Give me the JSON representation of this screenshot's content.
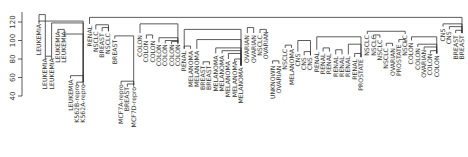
{
  "chart_data": {
    "type": "dendrogram",
    "title": "",
    "xlabel": "",
    "ylabel": "",
    "ylim": [
      40,
      130
    ],
    "yticks": [
      40,
      60,
      80,
      100,
      120
    ],
    "leaves": [
      "LEUKEMIA",
      "LEUKEMIA",
      "LEUKEMIA",
      "LEUKEMIA",
      "LEUKEMIA",
      "LEUKEMIA",
      "K562B-repro",
      "K562A-repro",
      "RENAL",
      "NSCLC",
      "BREAST",
      "NSCLC",
      "BREAST",
      "MCF7A-repro",
      "BREAST",
      "MCF7D-repro",
      "COLON",
      "COLON",
      "COLON",
      "COLON",
      "COLON",
      "COLON",
      "COLON",
      "RENAL",
      "MELANOMA",
      "MELANOMA",
      "BREAST",
      "BREAST",
      "MELANOMA",
      "MELANOMA",
      "MELANOMA",
      "MELANOMA",
      "MELANOMA",
      "OVARIAN",
      "OVARIAN",
      "NSCLC",
      "OVARIAN",
      "UNKNOWN",
      "OVARIAN",
      "NSCLC",
      "MELANOMA",
      "CNS",
      "CNS",
      "CNS",
      "RENAL",
      "RENAL",
      "RENAL",
      "RENAL",
      "RENAL",
      "RENAL",
      "RENAL",
      "PROSTATE",
      "NSCLC",
      "NSCLC",
      "NSCLC",
      "NSCLC",
      "OVARIAN",
      "PROSTATE",
      "NSCLC",
      "COLON",
      "COLON",
      "OVARIAN",
      "COLON",
      "COLON",
      "CNS",
      "CNS",
      "BREAST",
      "BREAST"
    ],
    "leaf_heights": [
      120,
      83,
      83,
      112,
      112,
      60,
      55,
      55,
      118,
      112,
      110,
      110,
      103,
      55,
      52,
      52,
      108,
      102,
      102,
      98,
      98,
      98,
      98,
      91,
      91,
      91,
      75,
      75,
      86,
      86,
      80,
      80,
      73,
      108,
      108,
      108,
      112,
      75,
      75,
      93,
      93,
      88,
      84,
      84,
      90,
      88,
      88,
      85,
      85,
      85,
      82,
      82,
      108,
      108,
      103,
      94,
      94,
      98,
      108,
      100,
      94,
      92,
      88,
      86,
      115,
      112,
      108,
      108
    ],
    "merges": [
      {
        "a": 0,
        "b": 1,
        "h": 128
      },
      {
        "a": 1,
        "b": 2,
        "h": 83
      },
      {
        "a": 3,
        "b": 4,
        "h": 112
      },
      {
        "a": 5,
        "b": 7,
        "h": 62
      },
      {
        "a": 6,
        "b": 7,
        "h": 55
      },
      {
        "a": 4,
        "b": 7,
        "h": 107
      },
      {
        "a": 2,
        "b": 7,
        "h": 119
      },
      {
        "a": 0,
        "b": 7,
        "h": 121
      },
      {
        "a": 8,
        "b": 67,
        "h": 125
      },
      {
        "a": 10,
        "b": 11,
        "h": 114
      },
      {
        "a": 9,
        "b": 11,
        "h": 117
      },
      {
        "a": 13,
        "b": 15,
        "h": 56
      },
      {
        "a": 14,
        "b": 15,
        "h": 53
      },
      {
        "a": 12,
        "b": 15,
        "h": 105
      },
      {
        "a": 16,
        "b": 22,
        "h": 118
      },
      {
        "a": 17,
        "b": 18,
        "h": 106
      },
      {
        "a": 19,
        "b": 22,
        "h": 103
      },
      {
        "a": 20,
        "b": 22,
        "h": 100
      },
      {
        "a": 21,
        "b": 22,
        "h": 99
      },
      {
        "a": 23,
        "b": 32,
        "h": 112
      },
      {
        "a": 23,
        "b": 24,
        "h": 94
      },
      {
        "a": 25,
        "b": 32,
        "h": 101
      },
      {
        "a": 26,
        "b": 27,
        "h": 77
      },
      {
        "a": 28,
        "b": 32,
        "h": 92
      },
      {
        "a": 29,
        "b": 32,
        "h": 89
      },
      {
        "a": 30,
        "b": 32,
        "h": 86
      },
      {
        "a": 31,
        "b": 32,
        "h": 80
      },
      {
        "a": 33,
        "b": 34,
        "h": 114
      },
      {
        "a": 35,
        "b": 36,
        "h": 112
      },
      {
        "a": 37,
        "b": 38,
        "h": 78
      },
      {
        "a": 39,
        "b": 40,
        "h": 95
      },
      {
        "a": 41,
        "b": 43,
        "h": 100
      },
      {
        "a": 42,
        "b": 43,
        "h": 88
      },
      {
        "a": 44,
        "b": 51,
        "h": 104
      },
      {
        "a": 45,
        "b": 46,
        "h": 92
      },
      {
        "a": 47,
        "b": 48,
        "h": 90
      },
      {
        "a": 49,
        "b": 51,
        "h": 96
      },
      {
        "a": 50,
        "b": 51,
        "h": 86
      },
      {
        "a": 52,
        "b": 58,
        "h": 110
      },
      {
        "a": 53,
        "b": 54,
        "h": 106
      },
      {
        "a": 55,
        "b": 56,
        "h": 97
      },
      {
        "a": 57,
        "b": 58,
        "h": 101
      },
      {
        "a": 59,
        "b": 63,
        "h": 104
      },
      {
        "a": 60,
        "b": 63,
        "h": 96
      },
      {
        "a": 61,
        "b": 63,
        "h": 93
      },
      {
        "a": 62,
        "b": 63,
        "h": 89
      },
      {
        "a": 64,
        "b": 67,
        "h": 118
      },
      {
        "a": 65,
        "b": 67,
        "h": 115
      },
      {
        "a": 66,
        "b": 67,
        "h": 111
      }
    ]
  }
}
